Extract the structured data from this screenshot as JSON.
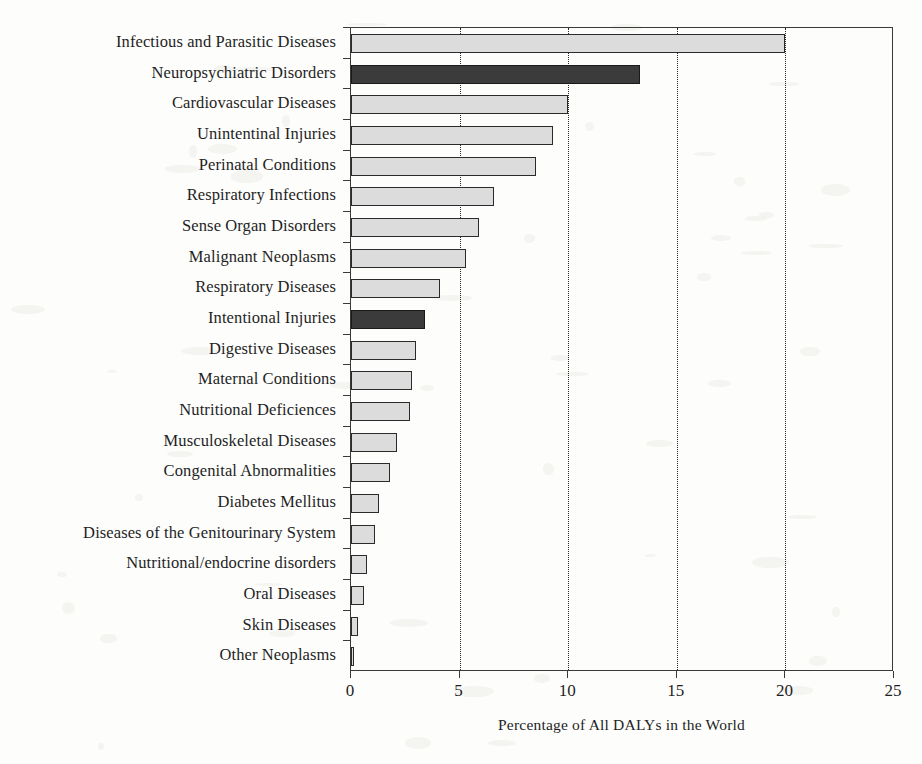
{
  "chart_data": {
    "type": "bar",
    "orientation": "horizontal",
    "title": "",
    "xlabel": "Percentage of All DALYs in the World",
    "ylabel": "",
    "xlim": [
      0,
      25
    ],
    "xticks": [
      0,
      5,
      10,
      15,
      20,
      25
    ],
    "xtick_labels": [
      "0",
      "5",
      "10",
      "15",
      "20",
      "25"
    ],
    "grid": "vertical dotted gridlines at 5, 10, 15, 20",
    "legend": "none",
    "categories": [
      "Infectious and Parasitic Diseases",
      "Neuropsychiatric Disorders",
      "Cardiovascular Diseases",
      "Unintentinal Injuries",
      "Perinatal Conditions",
      "Respiratory Infections",
      "Sense Organ Disorders",
      "Malignant Neoplasms",
      "Respiratory Diseases",
      "Intentional Injuries",
      "Digestive Diseases",
      "Maternal Conditions",
      "Nutritional Deficiences",
      "Musculoskeletal Diseases",
      "Congenital Abnormalities",
      "Diabetes Mellitus",
      "Diseases of the Genitourinary System",
      "Nutritional/endocrine disorders",
      "Oral Diseases",
      "Skin Diseases",
      "Other Neoplasms"
    ],
    "values": [
      20.0,
      13.3,
      10.0,
      9.3,
      8.5,
      6.6,
      5.9,
      5.3,
      4.1,
      3.4,
      3.0,
      2.8,
      2.7,
      2.1,
      1.8,
      1.3,
      1.1,
      0.75,
      0.6,
      0.3,
      0.15
    ],
    "highlighted": [
      "Neuropsychiatric Disorders",
      "Intentional Injuries"
    ],
    "colors": {
      "bar_fill": "#dcdcdc",
      "bar_highlight_fill": "#3b3b3b",
      "bar_edge": "#2b2b2b",
      "axis": "#3a3a3a",
      "text": "#1f1f1f",
      "background": "#fdfdfc"
    }
  }
}
